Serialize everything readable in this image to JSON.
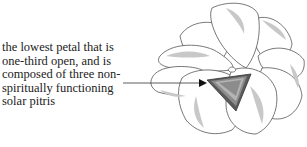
{
  "label": {
    "lines": [
      "the lowest petal that is",
      "one-third open, and is",
      "composed of three non-",
      "spiritually functioning",
      "solar pitris"
    ]
  },
  "figure": {
    "highlighted_part": "lowest-petal",
    "colors": {
      "outline": "#555555",
      "petal_fill": "#ffffff",
      "inner_shade": "#c8c8c8",
      "highlight_dark": "#5a5a5a",
      "highlight_mid": "#8c8c8c",
      "highlight_light": "#b4b4b4"
    }
  }
}
